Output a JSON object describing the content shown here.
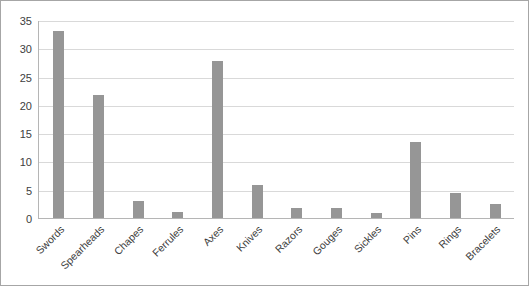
{
  "chart_data": {
    "type": "bar",
    "title": "",
    "subtitle": "",
    "xlabel": "",
    "ylabel": "",
    "categories": [
      "Swords",
      "Spearheads",
      "Chapes",
      "Ferrules",
      "Axes",
      "Knives",
      "Razors",
      "Gouges",
      "Sickles",
      "Pins",
      "Rings",
      "Bracelets"
    ],
    "values": [
      33,
      21.8,
      3,
      1,
      27.8,
      5.8,
      1.8,
      1.7,
      0.9,
      13.5,
      4.5,
      2.4
    ],
    "series": [
      {
        "name": "",
        "values": [
          33,
          21.8,
          3,
          1,
          27.8,
          5.8,
          1.8,
          1.7,
          0.9,
          13.5,
          4.5,
          2.4
        ]
      }
    ],
    "ylim": [
      0,
      35
    ],
    "yticks": [
      0,
      5,
      10,
      15,
      20,
      25,
      30,
      35
    ],
    "ytick_labels": [
      "0",
      "5",
      "10",
      "15",
      "20",
      "25",
      "30",
      "35"
    ],
    "grid": true,
    "grid_axis": "y",
    "legend": false,
    "legend_position": "none",
    "bar_color": "#969696",
    "grid_color": "#d9d9d9",
    "axis_color": "#b5b5b5",
    "border_color": "#a6a6a6",
    "background_color": "#ffffff",
    "tick_label_color": "#404040",
    "xtick_label_rotation": -45
  }
}
